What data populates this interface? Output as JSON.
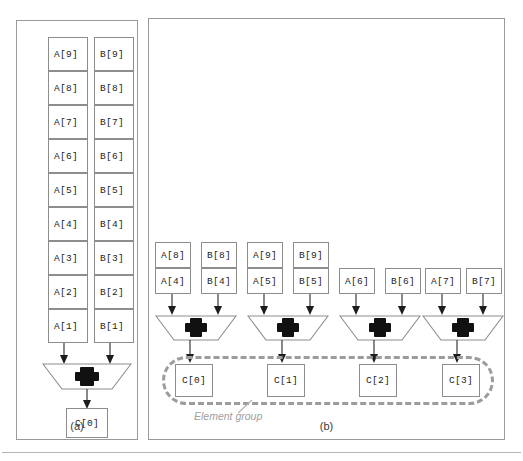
{
  "figure": {
    "background_color": "#ffffff",
    "line_color": "#8d8d8d",
    "group_color": "#9c9c9c"
  },
  "panel_a": {
    "caption": "(a)",
    "operator_symbol": "+",
    "operand_a_label": "A",
    "operand_b_label": "B",
    "column_a": [
      {
        "label": "A[9]"
      },
      {
        "label": "A[8]"
      },
      {
        "label": "A[7]"
      },
      {
        "label": "A[6]"
      },
      {
        "label": "A[5]"
      },
      {
        "label": "A[4]"
      },
      {
        "label": "A[3]"
      },
      {
        "label": "A[2]"
      },
      {
        "label": "A[1]"
      }
    ],
    "column_b": [
      {
        "label": "B[9]"
      },
      {
        "label": "B[8]"
      },
      {
        "label": "B[7]"
      },
      {
        "label": "B[6]"
      },
      {
        "label": "B[5]"
      },
      {
        "label": "B[4]"
      },
      {
        "label": "B[3]"
      },
      {
        "label": "B[2]"
      },
      {
        "label": "B[1]"
      }
    ],
    "result": {
      "label": "C[0]"
    }
  },
  "panel_b": {
    "caption": "(b)",
    "operator_symbol": "+",
    "group_label": "Element group",
    "lanes": [
      {
        "a_stack": [
          "A[8]",
          "A[4]"
        ],
        "b_stack": [
          "B[8]",
          "B[4]"
        ],
        "result": "C[0]"
      },
      {
        "a_stack": [
          "A[9]",
          "A[5]"
        ],
        "b_stack": [
          "B[9]",
          "B[5]"
        ],
        "result": "C[1]"
      },
      {
        "a_stack": [
          "A[6]"
        ],
        "b_stack": [
          "B[6]"
        ],
        "result": "C[2]"
      },
      {
        "a_stack": [
          "A[7]"
        ],
        "b_stack": [
          "B[7]"
        ],
        "result": "C[3]"
      }
    ]
  }
}
